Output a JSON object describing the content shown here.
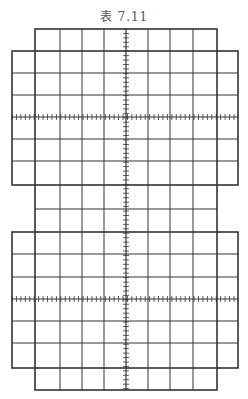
{
  "title": "表 7.11",
  "figure": {
    "line_color": "#333333",
    "outer_frame": {
      "x1": 35,
      "x2": 217,
      "y1": 29,
      "y2": 390
    },
    "wide_frames": [
      {
        "x1": 12,
        "x2": 238,
        "y1": 51,
        "y2": 185
      },
      {
        "x1": 12,
        "x2": 238,
        "y1": 232,
        "y2": 368
      }
    ],
    "vertical_lines": [
      60,
      82,
      104,
      148,
      170,
      193
    ],
    "horizontal_lines": [
      73,
      95,
      139,
      161,
      209,
      254,
      277,
      321,
      343
    ],
    "center_axis_x": 126,
    "axis_rows_y": [
      117,
      299
    ],
    "ticks_per_division": 5
  }
}
